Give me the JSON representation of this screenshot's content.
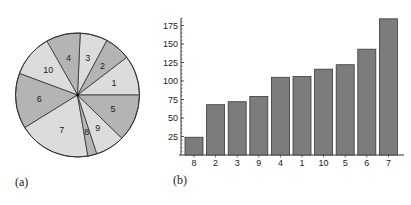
{
  "chart_data": [
    {
      "type": "pie",
      "panel_label": "(a)",
      "slices": [
        {
          "label": "1",
          "value": 105,
          "shade": "light"
        },
        {
          "label": "2",
          "value": 68,
          "shade": "dark"
        },
        {
          "label": "3",
          "value": 72,
          "shade": "light"
        },
        {
          "label": "4",
          "value": 90,
          "shade": "dark"
        },
        {
          "label": "10",
          "value": 112,
          "shade": "light"
        },
        {
          "label": "6",
          "value": 146,
          "shade": "dark"
        },
        {
          "label": "7",
          "value": 190,
          "shade": "light"
        },
        {
          "label": "8",
          "value": 24,
          "shade": "dark"
        },
        {
          "label": "9",
          "value": 77,
          "shade": "light"
        },
        {
          "label": "5",
          "value": 124,
          "shade": "dark"
        }
      ],
      "start_direction": "east",
      "order": "counterclockwise",
      "colors": {
        "light": "#dcdcdc",
        "dark": "#b4b4b4",
        "edge": "#333333"
      }
    },
    {
      "type": "bar",
      "panel_label": "(b)",
      "categories": [
        "8",
        "2",
        "3",
        "9",
        "4",
        "1",
        "10",
        "5",
        "6",
        "7"
      ],
      "values": [
        24,
        68,
        72,
        79,
        105,
        106,
        116,
        122,
        143,
        184
      ],
      "yticks": [
        25,
        50,
        75,
        100,
        125,
        150,
        175
      ],
      "ylim": [
        0,
        185
      ],
      "title": "",
      "xlabel": "",
      "ylabel": "",
      "grid": false,
      "colors": {
        "bar": "#7c7c7c",
        "edge": "#3a3a3a",
        "axis": "#333333"
      }
    }
  ]
}
